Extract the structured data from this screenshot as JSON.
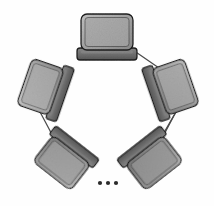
{
  "diagram": {
    "type": "ring-topology",
    "background_color": "#fefefe",
    "canvas": {
      "width": 214,
      "height": 206
    },
    "style": {
      "edge_color": "#4a4a4a",
      "edge_width": 1.25,
      "outline_color": "#1c1c1c",
      "screen_fill_light": "#b9b9b9",
      "screen_fill_mid": "#9a9a9a",
      "screen_fill_dark": "#6e6e6e",
      "base_fill_dark": "#5e5e5e",
      "base_fill_mid": "#7d7d7d",
      "dot_color": "#2b2b2b"
    },
    "node_count_visible": 5,
    "continuation_marker": "ellipsis",
    "nodes": [
      {
        "id": "node-top",
        "label": "laptop-node-top",
        "icon": "laptop-icon",
        "cx": 107,
        "cy": 36,
        "rotation": 0,
        "scale": 1.0,
        "screen_fill": "#9e9e9e",
        "base_fill": "#6f6f6f"
      },
      {
        "id": "node-upper-left",
        "label": "laptop-node-upper-left",
        "icon": "laptop-icon",
        "cx": 44,
        "cy": 88,
        "rotation": -71,
        "scale": 0.94,
        "screen_fill": "#a8a8a8",
        "base_fill": "#6a6a6a"
      },
      {
        "id": "node-upper-right",
        "label": "laptop-node-upper-right",
        "icon": "laptop-icon",
        "cx": 172,
        "cy": 88,
        "rotation": 71,
        "scale": 0.94,
        "screen_fill": "#a2a2a2",
        "base_fill": "#686868"
      },
      {
        "id": "node-lower-left",
        "label": "laptop-node-lower-left",
        "icon": "laptop-icon",
        "cx": 64,
        "cy": 160,
        "rotation": -142,
        "scale": 0.92,
        "screen_fill": "#9b9b9b",
        "base_fill": "#636363"
      },
      {
        "id": "node-lower-right",
        "label": "laptop-node-lower-right",
        "icon": "laptop-icon",
        "cx": 152,
        "cy": 160,
        "rotation": 142,
        "scale": 0.92,
        "screen_fill": "#8f8f8f",
        "base_fill": "#5d5d5d"
      }
    ],
    "edges": [
      {
        "id": "edge-top-upperleft",
        "from": "node-top",
        "to": "node-upper-left",
        "x1": 85,
        "y1": 48,
        "x2": 57,
        "y2": 68
      },
      {
        "id": "edge-top-upperright",
        "from": "node-top",
        "to": "node-upper-right",
        "x1": 130,
        "y1": 48,
        "x2": 159,
        "y2": 68
      },
      {
        "id": "edge-upperleft-lowerleft",
        "from": "node-upper-left",
        "to": "node-lower-left",
        "x1": 39,
        "y1": 110,
        "x2": 56,
        "y2": 142
      },
      {
        "id": "edge-upperright-lowerright",
        "from": "node-upper-right",
        "to": "node-lower-right",
        "x1": 177,
        "y1": 110,
        "x2": 160,
        "y2": 142
      }
    ],
    "ellipsis": {
      "id": "ring-continuation-ellipsis",
      "description": "three dots indicating additional nodes",
      "dots": [
        {
          "cx": 100,
          "cy": 183,
          "r": 2.1
        },
        {
          "cx": 108,
          "cy": 183,
          "r": 2.1
        },
        {
          "cx": 116,
          "cy": 183,
          "r": 2.1
        }
      ]
    }
  }
}
